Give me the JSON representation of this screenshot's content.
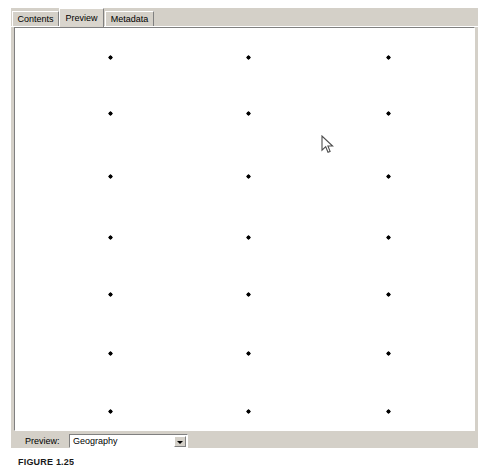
{
  "window": {
    "title": "Preview",
    "background_color": "#d4d0c8"
  },
  "tabs": [
    {
      "label": "Contents",
      "selected": false
    },
    {
      "label": "Preview",
      "selected": true
    },
    {
      "label": "Metadata",
      "selected": false
    }
  ],
  "preview_bar": {
    "label": "Preview:",
    "combo": {
      "value": "Geography",
      "placeholder": "Geography",
      "arrow_icon": "chevron-down-icon",
      "options": [
        "Geography",
        "Table",
        "3D View"
      ]
    }
  },
  "cursor": {
    "icon": "arrow-cursor",
    "x": 321,
    "y": 135
  },
  "caption": {
    "text": "FIGURE 1.25"
  },
  "chart_data": {
    "type": "scatter",
    "title": "",
    "subtitle": "",
    "xlabel": "",
    "ylabel": "",
    "grid": false,
    "legend": "none",
    "marker": "diamond",
    "marker_color": "#000000",
    "marker_size_px": 5,
    "background": "#ffffff",
    "canvas_px": {
      "width": 461,
      "height": 404
    },
    "xlim": [
      0,
      461
    ],
    "ylim": [
      0,
      404
    ],
    "x_tick_labels": [],
    "y_tick_labels": [],
    "columns_x_px": [
      95,
      233,
      373
    ],
    "rows_y_px": [
      29,
      85,
      148,
      209,
      266,
      325,
      383
    ],
    "points": [
      {
        "x": 95,
        "y": 29
      },
      {
        "x": 233,
        "y": 29
      },
      {
        "x": 373,
        "y": 29
      },
      {
        "x": 95,
        "y": 85
      },
      {
        "x": 233,
        "y": 85
      },
      {
        "x": 373,
        "y": 85
      },
      {
        "x": 95,
        "y": 148
      },
      {
        "x": 233,
        "y": 148
      },
      {
        "x": 373,
        "y": 148
      },
      {
        "x": 95,
        "y": 209
      },
      {
        "x": 233,
        "y": 209
      },
      {
        "x": 373,
        "y": 209
      },
      {
        "x": 95,
        "y": 266
      },
      {
        "x": 233,
        "y": 266
      },
      {
        "x": 373,
        "y": 266
      },
      {
        "x": 95,
        "y": 325
      },
      {
        "x": 233,
        "y": 325
      },
      {
        "x": 373,
        "y": 325
      },
      {
        "x": 95,
        "y": 383
      },
      {
        "x": 233,
        "y": 383
      },
      {
        "x": 373,
        "y": 383
      }
    ],
    "point_count": 21
  }
}
